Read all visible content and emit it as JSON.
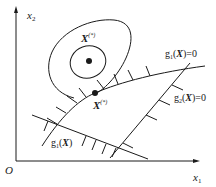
{
  "figure": {
    "axes": {
      "x_label": "x",
      "x_sub": "1",
      "y_label": "x",
      "y_sub": "2",
      "origin_label": "O"
    },
    "points": {
      "unconstrained_optimum": {
        "base": "X",
        "sup": "(*)"
      },
      "constrained_optimum": {
        "base": "X",
        "sup": "(*)"
      }
    },
    "constraints": [
      {
        "prefix": "g",
        "sub": "1",
        "open": "(",
        "var": "X",
        "close": ")",
        "suffix": "=0"
      },
      {
        "prefix": "g",
        "sub": "2",
        "open": "(",
        "var": "X",
        "close": ")",
        "suffix": "=0"
      },
      {
        "prefix": "g",
        "sub": "1",
        "open": "(",
        "var": "X",
        "close": ")",
        "suffix": ""
      }
    ],
    "colors": {
      "line": "#1a1a1a",
      "background": "#ffffff"
    }
  }
}
